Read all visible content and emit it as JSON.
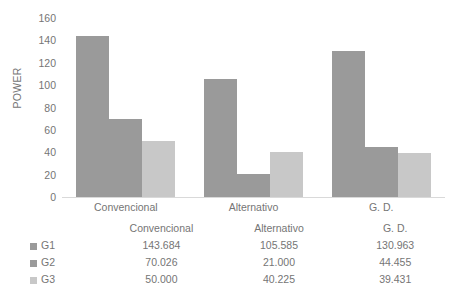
{
  "chart_data": {
    "type": "bar",
    "title": "",
    "xlabel": "",
    "ylabel": "POWER",
    "categories": [
      "Convencional",
      "Alternativo",
      "G. D."
    ],
    "series": [
      {
        "name": "G1",
        "values": [
          143.684,
          105.585,
          130.963
        ],
        "color": "#9a9a9a"
      },
      {
        "name": "G2",
        "values": [
          70.026,
          21.0,
          44.455
        ],
        "color": "#9a9a9a"
      },
      {
        "name": "G3",
        "values": [
          50.0,
          40.225,
          39.431
        ],
        "color": "#c8c8c8"
      }
    ],
    "ylim": [
      0,
      160
    ],
    "yticks": [
      160,
      140,
      120,
      100,
      80,
      60,
      40,
      20,
      0
    ],
    "grid": false,
    "legend_position": "table-left",
    "data_table_visible": true
  },
  "table": {
    "value_labels": [
      [
        "143.684",
        "105.585",
        "130.963"
      ],
      [
        "70.026",
        "21.000",
        "44.455"
      ],
      [
        "50.000",
        "40.225",
        "39.431"
      ]
    ]
  },
  "colors": {
    "bar_dark": "#9a9a9a",
    "bar_light": "#c8c8c8",
    "text": "#757575",
    "baseline": "#d9d9d9",
    "background": "#ffffff"
  }
}
